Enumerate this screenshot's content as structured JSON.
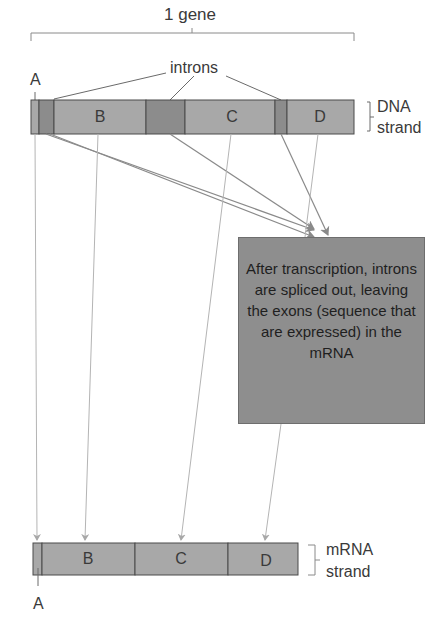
{
  "title": "1 gene",
  "labels": {
    "introns": "introns",
    "exon_a_top": "A",
    "exon_a_bottom": "A",
    "dna_line1": "DNA",
    "dna_line2": "strand",
    "mrna_line1": "mRNA",
    "mrna_line2": "strand"
  },
  "dna_strand": {
    "segments": [
      {
        "type": "exon",
        "label": "A"
      },
      {
        "type": "intron",
        "label": ""
      },
      {
        "type": "exon",
        "label": "B"
      },
      {
        "type": "intron",
        "label": ""
      },
      {
        "type": "exon",
        "label": "C"
      },
      {
        "type": "intron",
        "label": ""
      },
      {
        "type": "exon",
        "label": "D"
      }
    ]
  },
  "mrna_strand": {
    "segments": [
      {
        "type": "exon",
        "label": "A"
      },
      {
        "type": "exon",
        "label": "B"
      },
      {
        "type": "exon",
        "label": "C"
      },
      {
        "type": "exon",
        "label": "D"
      }
    ]
  },
  "seg_labels": {
    "dna_b": "B",
    "dna_c": "C",
    "dna_d": "D",
    "mrna_b": "B",
    "mrna_c": "C",
    "mrna_d": "D"
  },
  "callout": {
    "text": "After transcription, introns are spliced out, leaving the exons (sequence that are expressed) in the mRNA"
  },
  "colors": {
    "exon": "#a8a8a8",
    "intron": "#8c8c8c",
    "outline": "#4a4a4a",
    "arrow": "#b4b4b4",
    "callout_bg": "#8e8e8e"
  }
}
